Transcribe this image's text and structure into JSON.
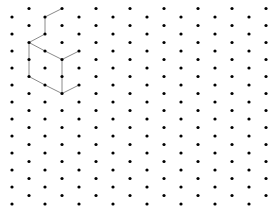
{
  "diagram": {
    "type": "isometric-dot-grid",
    "background": "#ffffff",
    "dot_color": "#000000",
    "line_color": "#8a8a8a",
    "dot_radius": 1.6,
    "line_width": 1,
    "grid": {
      "columns_x": [
        12,
        29,
        45,
        62,
        79,
        96,
        113,
        130,
        147,
        164,
        181,
        198,
        215,
        232,
        249,
        266
      ],
      "even_column_start_y": 17,
      "odd_column_start_y": 8.5,
      "row_spacing": 17,
      "rows_per_column": 12
    },
    "shape_polylines": [
      [
        [
          62,
          8.5
        ],
        [
          45,
          17
        ],
        [
          45,
          34
        ],
        [
          29,
          42.5
        ],
        [
          45,
          51
        ],
        [
          62,
          59.5
        ],
        [
          79,
          51
        ]
      ],
      [
        [
          29,
          42.5
        ],
        [
          29,
          59.5
        ],
        [
          29,
          76.5
        ],
        [
          45,
          85
        ],
        [
          62,
          93.5
        ],
        [
          79,
          85
        ]
      ],
      [
        [
          62,
          59.5
        ],
        [
          62,
          76.5
        ],
        [
          62,
          93.5
        ]
      ]
    ]
  }
}
